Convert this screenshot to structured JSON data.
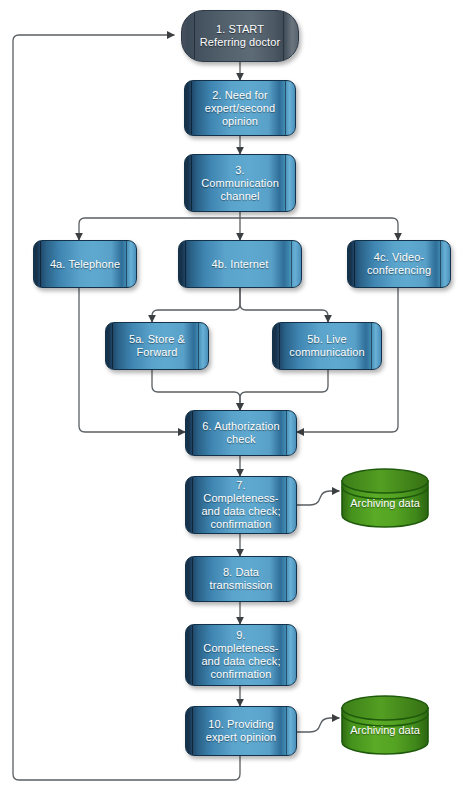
{
  "diagram": {
    "background": "#ffffff",
    "colors": {
      "process_fill": "#4a90bb",
      "process_edge": "#12324b",
      "start_fill": "#55636f",
      "database_fill": "#4f9c1f",
      "database_edge": "#1f5a0c",
      "connector": "#5a5f63",
      "label_text": "#ffffff"
    },
    "nodes": [
      {
        "id": "n1",
        "key": "start",
        "shape": "stadium",
        "label": "1. START\nReferring doctor",
        "lines": [
          "1. START",
          "Referring doctor"
        ]
      },
      {
        "id": "n2",
        "key": "need",
        "shape": "process",
        "label": "2. Need for expert/second opinion",
        "lines": [
          "2. Need for",
          "expert/second",
          "opinion"
        ]
      },
      {
        "id": "n3",
        "key": "channel",
        "shape": "process",
        "label": "3. Communication channel",
        "lines": [
          "3.",
          "Communication",
          "channel"
        ]
      },
      {
        "id": "n4a",
        "key": "telephone",
        "shape": "process",
        "label": "4a. Telephone",
        "lines": [
          "4a. Telephone"
        ]
      },
      {
        "id": "n4b",
        "key": "internet",
        "shape": "process",
        "label": "4b. Internet",
        "lines": [
          "4b. Internet"
        ]
      },
      {
        "id": "n4c",
        "key": "videoconf",
        "shape": "process",
        "label": "4c. Video-conferencing",
        "lines": [
          "4c. Video-",
          "conferencing"
        ]
      },
      {
        "id": "n5a",
        "key": "store_forward",
        "shape": "process",
        "label": "5a. Store & Forward",
        "lines": [
          "5a. Store &",
          "Forward"
        ]
      },
      {
        "id": "n5b",
        "key": "live_comm",
        "shape": "process",
        "label": "5b. Live communication",
        "lines": [
          "5b. Live",
          "communication"
        ]
      },
      {
        "id": "n6",
        "key": "authorization",
        "shape": "process",
        "label": "6. Authorization check",
        "lines": [
          "6. Authorization",
          "check"
        ]
      },
      {
        "id": "n7",
        "key": "check1",
        "shape": "process",
        "label": "7. Completeness- and data check; confirmation",
        "lines": [
          "7.",
          "Completeness-",
          "and data check;",
          "confirmation"
        ]
      },
      {
        "id": "n8",
        "key": "transmission",
        "shape": "process",
        "label": "8. Data transmission",
        "lines": [
          "8. Data",
          "transmission"
        ]
      },
      {
        "id": "n9",
        "key": "check2",
        "shape": "process",
        "label": "9. Completeness- and data check; confirmation",
        "lines": [
          "9.",
          "Completeness-",
          "and data check;",
          "confirmation"
        ]
      },
      {
        "id": "n10",
        "key": "expert_opinion",
        "shape": "process",
        "label": "10. Providing expert opinion",
        "lines": [
          "10. Providing",
          "expert opinion"
        ]
      },
      {
        "id": "db1",
        "key": "archive_top",
        "shape": "database",
        "label": "Archiving data",
        "lines": [
          "Archiving data"
        ]
      },
      {
        "id": "db2",
        "key": "archive_bottom",
        "shape": "database",
        "label": "Archiving data",
        "lines": [
          "Archiving data"
        ]
      }
    ],
    "edges": [
      {
        "from": "n1",
        "to": "n2",
        "label": ""
      },
      {
        "from": "n2",
        "to": "n3",
        "label": ""
      },
      {
        "from": "n3",
        "to": "n4a",
        "label": ""
      },
      {
        "from": "n3",
        "to": "n4b",
        "label": ""
      },
      {
        "from": "n3",
        "to": "n4c",
        "label": ""
      },
      {
        "from": "n4b",
        "to": "n5a",
        "label": ""
      },
      {
        "from": "n4b",
        "to": "n5b",
        "label": ""
      },
      {
        "from": "n4a",
        "to": "n6",
        "label": ""
      },
      {
        "from": "n4c",
        "to": "n6",
        "label": ""
      },
      {
        "from": "n5a",
        "to": "n6",
        "label": ""
      },
      {
        "from": "n5b",
        "to": "n6",
        "label": ""
      },
      {
        "from": "n6",
        "to": "n7",
        "label": ""
      },
      {
        "from": "n7",
        "to": "db1",
        "label": ""
      },
      {
        "from": "n7",
        "to": "n8",
        "label": ""
      },
      {
        "from": "n8",
        "to": "n9",
        "label": ""
      },
      {
        "from": "n9",
        "to": "n10",
        "label": ""
      },
      {
        "from": "n10",
        "to": "db2",
        "label": ""
      },
      {
        "from": "n10",
        "to": "n1",
        "label": ""
      }
    ]
  }
}
